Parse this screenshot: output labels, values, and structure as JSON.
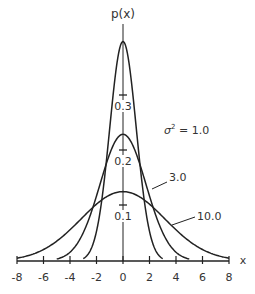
{
  "chart_data": {
    "type": "line",
    "title": "",
    "xlabel": "x",
    "ylabel": "p(x)",
    "xlim": [
      -8,
      8
    ],
    "ylim": [
      0,
      0.4
    ],
    "x_ticks": [
      -8,
      -6,
      -4,
      -2,
      0,
      2,
      4,
      6,
      8
    ],
    "y_ticks": [
      0.1,
      0.2,
      0.3
    ],
    "grid": false,
    "series": [
      {
        "name": "σ² = 1.0",
        "variance": 1.0,
        "peak": 0.399,
        "x_range": [
          -3,
          3
        ]
      },
      {
        "name": "3.0",
        "variance": 3.0,
        "peak": 0.23,
        "x_range": [
          -5,
          5
        ]
      },
      {
        "name": "10.0",
        "variance": 10.0,
        "peak": 0.126,
        "x_range": [
          -8,
          8
        ]
      }
    ],
    "annotations": [
      {
        "text": "σ² = 1.0",
        "attached_to": "variance 1.0 curve"
      },
      {
        "text": "3.0",
        "attached_to": "variance 3.0 curve"
      },
      {
        "text": "10.0",
        "attached_to": "variance 10.0 curve"
      }
    ]
  },
  "labels": {
    "ylabel": "p(x)",
    "xlabel": "x",
    "yticks": [
      "0.3",
      "0.2",
      "0.1"
    ],
    "xticks": [
      "-8",
      "-6",
      "-4",
      "-2",
      "0",
      "2",
      "4",
      "6",
      "8"
    ],
    "ann_s1": "σ",
    "ann_s1_sup": "2",
    "ann_s1_rest": " = 1.0",
    "ann_s3": "3.0",
    "ann_s10": "10.0"
  },
  "colors": {
    "line": "#222222",
    "text": "#333333",
    "background": "#ffffff"
  }
}
